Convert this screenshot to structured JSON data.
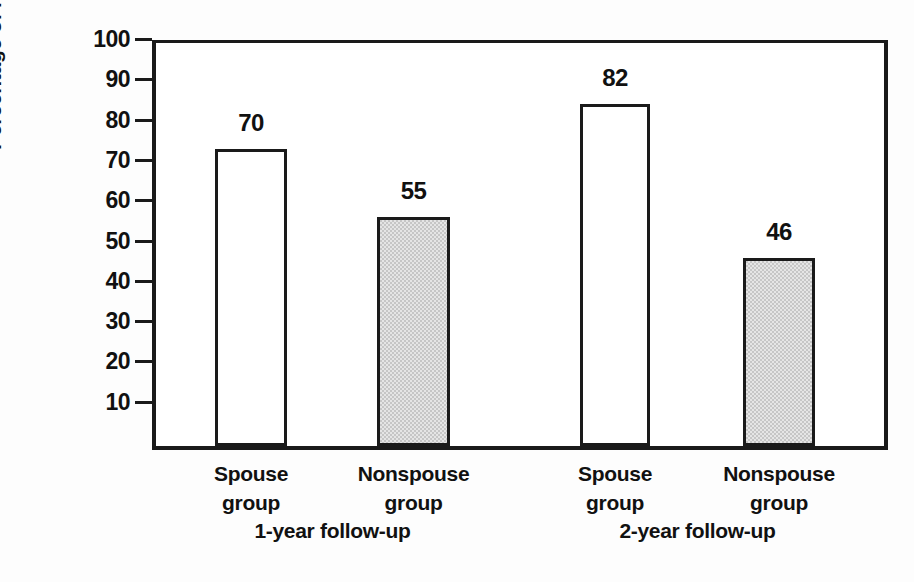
{
  "chart_data": {
    "type": "bar",
    "title": "",
    "subtitle": "",
    "xlabel": "",
    "ylabel": "Percentage of responders",
    "ylim": [
      0,
      100
    ],
    "grid": false,
    "legend": "none",
    "categories": [
      "Spouse group (1-year follow-up)",
      "Nonspouse group (1-year follow-up)",
      "Spouse group (2-year follow-up)",
      "Nonspouse group (2-year follow-up)"
    ],
    "values": [
      70,
      55,
      82,
      46
    ],
    "value_labels": [
      "70",
      "55",
      "82",
      "46"
    ],
    "bar_styles": [
      "white",
      "gray",
      "white",
      "gray"
    ],
    "y_ticks": [
      10,
      20,
      30,
      40,
      50,
      60,
      70,
      80,
      90,
      100
    ],
    "y_tick_labels": [
      "10",
      "20",
      "30",
      "40",
      "50",
      "60",
      "70",
      "80",
      "90",
      "100"
    ],
    "groups": [
      {
        "super_label": "1-year follow-up",
        "bars": [
          {
            "line1": "Spouse",
            "line2": "group",
            "value_label": "70",
            "style": "white"
          },
          {
            "line1": "Nonspouse",
            "line2": "group",
            "value_label": "55",
            "style": "gray"
          }
        ]
      },
      {
        "super_label": "2-year follow-up",
        "bars": [
          {
            "line1": "Spouse",
            "line2": "group",
            "value_label": "82",
            "style": "white"
          },
          {
            "line1": "Nonspouse",
            "line2": "group",
            "value_label": "46",
            "style": "gray"
          }
        ]
      }
    ],
    "colors": {
      "axis": "#1a1a1a",
      "bar_outline": "#1a1a1a",
      "bar_white_fill": "#ffffff",
      "bar_gray_fill": "#c6c6c6",
      "text": "#111111",
      "background": "#fdfdfd"
    }
  }
}
